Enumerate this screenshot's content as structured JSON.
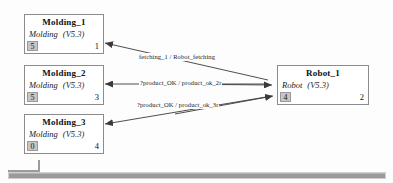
{
  "diagram": {
    "nodes": [
      {
        "name": "Molding_1",
        "type": "Molding",
        "version": "(V5.3)",
        "slot": "5",
        "index": "1"
      },
      {
        "name": "Molding_2",
        "type": "Molding",
        "version": "(V5.3)",
        "slot": "5",
        "index": "3"
      },
      {
        "name": "Molding_3",
        "type": "Molding",
        "version": "(V5.3)",
        "slot": "0",
        "index": "4"
      },
      {
        "name": "Robot_1",
        "type": "Robot",
        "version": "(V5.3)",
        "slot": "4",
        "index": "2"
      }
    ],
    "edges": [
      {
        "label": "fetching_1 / Robot_fetching"
      },
      {
        "label": "?product_OK / product_ok_2r"
      },
      {
        "label": "?product_OK / product_ok_3r"
      }
    ]
  },
  "colors": {
    "node_border": "#8c8c8c",
    "slot_fill": "#c6c6c6",
    "edge_stroke": "#3a3a3a",
    "scrollbar_thumb": "#9a9a9a",
    "canvas_background": "#fdfdfd"
  },
  "chrome": {
    "scrollbar_name": "horizontal-scrollbar"
  }
}
